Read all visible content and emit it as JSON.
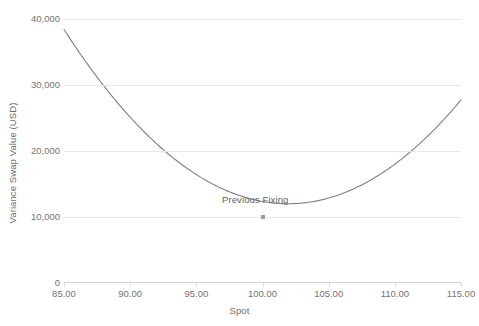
{
  "chart_data": {
    "type": "line",
    "title": "",
    "xlabel": "Spot",
    "ylabel": "Variance Swap Value (USD)",
    "xlim": [
      85,
      115
    ],
    "ylim": [
      0,
      40000
    ],
    "grid": true,
    "legend": "none",
    "x_ticks": [
      "85.00",
      "90.00",
      "95.00",
      "100.00",
      "105.00",
      "110.00",
      "115.00"
    ],
    "x_tick_values": [
      85,
      90,
      95,
      100,
      105,
      110,
      115
    ],
    "y_ticks": [
      "0",
      "10,000",
      "20,000",
      "30,000",
      "40,000"
    ],
    "y_tick_values": [
      0,
      10000,
      20000,
      30000,
      40000
    ],
    "series": [
      {
        "name": "Variance Swap Value",
        "color": "#7f7f7f",
        "x": [
          85,
          86,
          87,
          88,
          89,
          90,
          91,
          92,
          93,
          94,
          95,
          96,
          97,
          98,
          99,
          100,
          101,
          102,
          103,
          104,
          105,
          106,
          107,
          108,
          109,
          110,
          111,
          112,
          113,
          114,
          115
        ],
        "values": [
          36600,
          34200,
          31900,
          29700,
          27700,
          25700,
          23900,
          22200,
          20600,
          19100,
          17700,
          16400,
          15200,
          14100,
          13200,
          10000,
          12000,
          11700,
          11600,
          11700,
          12000,
          12600,
          13400,
          14500,
          15800,
          17400,
          19200,
          21300,
          23600,
          26500,
          29800
        ]
      }
    ],
    "annotations": [
      {
        "text": "Previous Fixing",
        "x": 100,
        "y": 10000,
        "marker": "square",
        "marker_color": "#9a9a9a"
      }
    ]
  }
}
